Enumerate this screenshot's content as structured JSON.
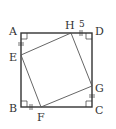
{
  "diagram": {
    "type": "geometry",
    "colors": {
      "stroke": "#333333",
      "background": "#ffffff"
    },
    "outer_square": {
      "vertices": [
        "A",
        "B",
        "C",
        "D"
      ]
    },
    "inner_square": {
      "vertices": [
        "E",
        "F",
        "G",
        "H"
      ]
    },
    "labels": {
      "A": "A",
      "B": "B",
      "C": "C",
      "D": "D",
      "E": "E",
      "F": "F",
      "G": "G",
      "H": "H"
    },
    "measurements": {
      "HD": "5"
    },
    "markers": {
      "right_angles": [
        "A",
        "B",
        "C",
        "D"
      ],
      "equal_ticks": [
        "AE",
        "BF",
        "CG",
        "HD"
      ]
    }
  }
}
